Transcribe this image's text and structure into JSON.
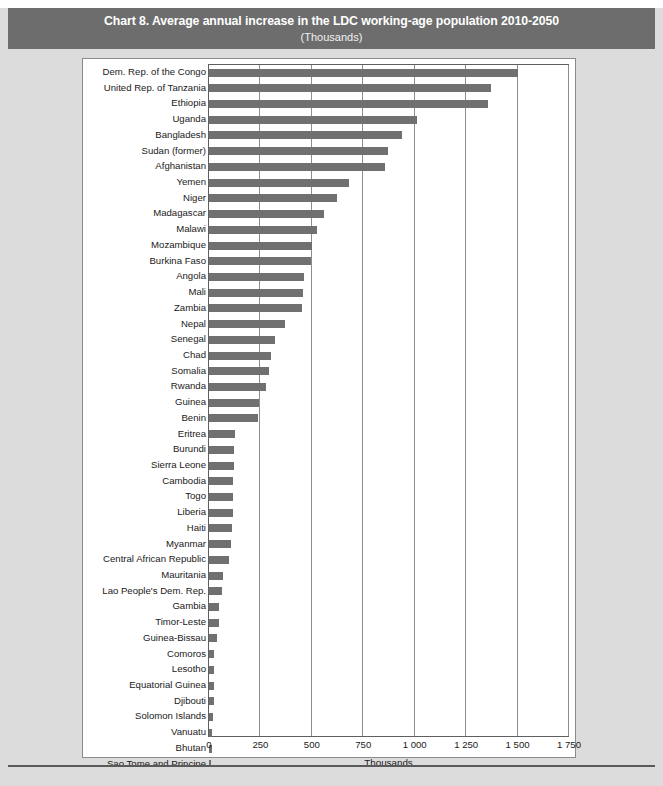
{
  "title": {
    "main": "Chart 8. Average annual increase in the LDC working-age population 2010-2050",
    "sub": "(Thousands)"
  },
  "colors": {
    "title_band": "#6d6d6d",
    "bar": "#707070",
    "page_background": "#dcdcdc",
    "plot_background": "#ffffff",
    "gridline": "#8d8d8d"
  },
  "chart_data": {
    "type": "bar",
    "orientation": "horizontal",
    "title": "Chart 8. Average annual increase in the LDC working-age population 2010-2050",
    "subtitle": "(Thousands)",
    "xlabel": "Thousands",
    "ylabel": "",
    "xlim": [
      0,
      1750
    ],
    "xticks": [
      0,
      250,
      500,
      750,
      1000,
      1250,
      1500,
      1750
    ],
    "xtick_labels": [
      "0",
      "250",
      "500",
      "750",
      "1 000",
      "1 250",
      "1 500",
      "1 750"
    ],
    "grid": "vertical",
    "legend": null,
    "categories": [
      "Dem. Rep. of the Congo",
      "United Rep. of Tanzania",
      "Ethiopia",
      "Uganda",
      "Bangladesh",
      "Sudan (former)",
      "Afghanistan",
      "Yemen",
      "Niger",
      "Madagascar",
      "Malawi",
      "Mozambique",
      "Burkina Faso",
      "Angola",
      "Mali",
      "Zambia",
      "Nepal",
      "Senegal",
      "Chad",
      "Somalia",
      "Rwanda",
      "Guinea",
      "Benin",
      "Eritrea",
      "Burundi",
      "Sierra Leone",
      "Cambodia",
      "Togo",
      "Liberia",
      "Haiti",
      "Myanmar",
      "Central African Republic",
      "Mauritania",
      "Lao People's Dem. Rep.",
      "Gambia",
      "Timor-Leste",
      "Guinea-Bissau",
      "Comoros",
      "Lesotho",
      "Equatorial Guinea",
      "Djibouti",
      "Solomon Islands",
      "Vanuatu",
      "Bhutan",
      "Sao Tome and Principe",
      "Samoa"
    ],
    "values": [
      1500,
      1370,
      1355,
      1010,
      940,
      870,
      855,
      680,
      620,
      560,
      525,
      500,
      495,
      460,
      455,
      450,
      370,
      320,
      300,
      290,
      275,
      245,
      240,
      125,
      120,
      120,
      118,
      115,
      115,
      110,
      105,
      95,
      70,
      62,
      50,
      47,
      38,
      25,
      25,
      24,
      22,
      20,
      14,
      13,
      11,
      9
    ]
  }
}
